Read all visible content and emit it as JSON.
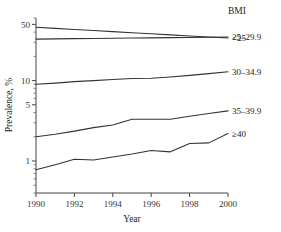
{
  "chart_data": {
    "type": "line",
    "title": "",
    "xlabel": "Year",
    "ylabel": "Prevalence, %",
    "legend_title": "BMI",
    "legend_position": "right",
    "grid": false,
    "yscale": "log",
    "ylim": [
      0.4,
      60
    ],
    "xlim": [
      1990,
      2000
    ],
    "x": [
      1990,
      1991,
      1992,
      1993,
      1994,
      1995,
      1996,
      1997,
      1998,
      1999,
      2000
    ],
    "y_tick_labels": [
      "50",
      "10",
      "5",
      "1"
    ],
    "y_tick_values": [
      50,
      10,
      5,
      1
    ],
    "x_tick_labels": [
      "1990",
      "1992",
      "1994",
      "1996",
      "1998",
      "2000"
    ],
    "x_tick_values": [
      1990,
      1992,
      1994,
      1996,
      1998,
      2000
    ],
    "series": [
      {
        "name": "<25",
        "values": [
          46.0,
          44.6,
          43.2,
          41.9,
          40.6,
          39.4,
          38.2,
          37.0,
          35.9,
          34.8,
          33.8
        ]
      },
      {
        "name": "25–29.9",
        "values": [
          32.8,
          33.0,
          33.2,
          33.4,
          33.6,
          33.8,
          34.0,
          34.2,
          34.4,
          34.6,
          34.8
        ]
      },
      {
        "name": "30–34.9",
        "values": [
          9.0,
          9.3,
          9.7,
          10.0,
          10.3,
          10.6,
          10.7,
          11.1,
          11.6,
          12.2,
          12.9
        ]
      },
      {
        "name": "35–39.9",
        "values": [
          2.0,
          2.15,
          2.35,
          2.6,
          2.8,
          3.3,
          3.3,
          3.3,
          3.6,
          3.9,
          4.2
        ]
      },
      {
        "name": "≥40",
        "values": [
          0.78,
          0.9,
          1.05,
          1.03,
          1.12,
          1.22,
          1.35,
          1.3,
          1.65,
          1.68,
          2.2
        ]
      }
    ]
  }
}
